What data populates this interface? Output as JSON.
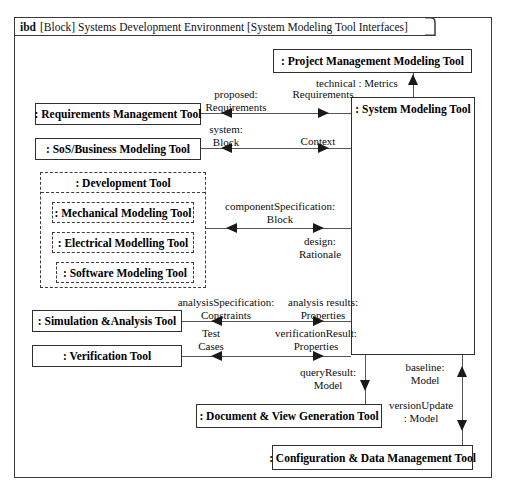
{
  "diagram": {
    "header": {
      "keyword": "ibd",
      "title": "[Block] Systems Development Environment [System Modeling Tool Interfaces]"
    },
    "blocks": {
      "requirements_management_tool": ": Requirements Management Tool",
      "sos_business_modeling_tool": ": SoS/Business Modeling Tool",
      "development_tool": ": Development Tool",
      "mechanical_modeling_tool": ": Mechanical Modeling Tool",
      "electrical_modelling_tool": ": Electrical Modelling Tool",
      "software_modeling_tool": ": Software Modeling Tool",
      "simulation_analysis_tool": ": Simulation &Analysis Tool",
      "verification_tool": ": Verification Tool",
      "project_management_modeling_tool": ": Project Management Modeling Tool",
      "system_modeling_tool": ": System Modeling Tool",
      "document_view_generation_tool": ": Document & View Generation Tool",
      "configuration_data_management_tool": ": Configuration & Data Management Tool"
    },
    "connectors": {
      "proposed_requirements": {
        "line1": "proposed:",
        "line2": "Requirements"
      },
      "requirements": {
        "line1": "Requirements",
        "line2": ""
      },
      "system_block": {
        "line1": "system:",
        "line2": "Block"
      },
      "context": {
        "line1": "Context",
        "line2": ""
      },
      "technical_metrics": {
        "line1": "technical : Metrics",
        "line2": ""
      },
      "component_specification": {
        "line1": "componentSpecification:",
        "line2": "Block"
      },
      "design_rationale": {
        "line1": "design:",
        "line2": "Rationale"
      },
      "analysis_specification": {
        "line1": "analysisSpecification:",
        "line2": "Constraints"
      },
      "analysis_results": {
        "line1": "analysis results:",
        "line2": "Properties"
      },
      "test_cases": {
        "line1": "Test",
        "line2": "Cases"
      },
      "verification_result": {
        "line1": "verificationResult:",
        "line2": "Properties"
      },
      "query_result": {
        "line1": "queryResult:",
        "line2": "Model"
      },
      "baseline_model": {
        "line1": "baseline:",
        "line2": "Model"
      },
      "version_update": {
        "line1": "versionUpdate",
        "line2": ": Model"
      }
    },
    "colors": {
      "frame": "#3a3a3a",
      "block_border": "#2e2e2e",
      "dashed_border": "#3b3b3b",
      "connector": "#555555",
      "arrow": "#1a1a1a",
      "text": "#000000",
      "background": "#ffffff"
    }
  }
}
